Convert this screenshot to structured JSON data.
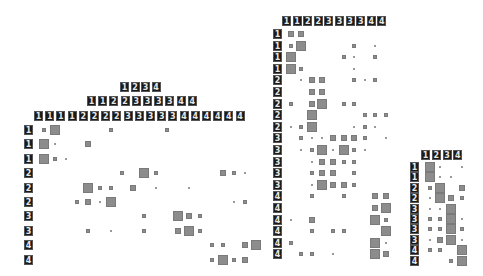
{
  "figure": {
    "size_scale_px": {
      "0": 0,
      "1": 2,
      "2": 4,
      "3": 6,
      "4": 10
    },
    "cell_color": "#8c8c8c",
    "panels": [
      {
        "name": "left",
        "headers": [
          {
            "x": 120,
            "y": 82,
            "dx": 10.5,
            "labels": [
              "1",
              "2",
              "3",
              "4"
            ]
          },
          {
            "x": 87,
            "y": 96,
            "dx": 11.2,
            "labels": [
              "1",
              "1",
              "2",
              "2",
              "3",
              "3",
              "3",
              "3",
              "4",
              "4"
            ]
          },
          {
            "x": 34,
            "y": 111,
            "dx": 11.2,
            "labels": [
              "1",
              "1",
              "1",
              "1",
              "2",
              "2",
              "2",
              "2",
              "3",
              "3",
              "3",
              "3",
              "3",
              "4",
              "4",
              "4",
              "4",
              "4",
              "4"
            ]
          }
        ],
        "row_label_x": 24,
        "cell_x0": 39,
        "cell_dx": 11.2,
        "row_y0": 125,
        "row_dy": 14.4,
        "row_labels": [
          "1",
          "1",
          "1",
          "2",
          "2",
          "2",
          "3",
          "3",
          "4",
          "4"
        ],
        "matrix": [
          [
            2,
            4,
            0,
            0,
            0,
            0,
            2,
            0,
            0,
            0,
            0,
            2,
            0,
            0,
            0,
            0,
            0,
            0,
            0
          ],
          [
            4,
            1,
            0,
            0,
            3,
            0,
            0,
            0,
            0,
            0,
            0,
            0,
            0,
            0,
            0,
            0,
            0,
            0,
            0
          ],
          [
            4,
            2,
            1,
            0,
            0,
            0,
            0,
            0,
            0,
            0,
            0,
            0,
            0,
            0,
            0,
            0,
            0,
            0,
            0
          ],
          [
            0,
            0,
            0,
            0,
            0,
            0,
            0,
            2,
            0,
            4,
            2,
            0,
            0,
            0,
            0,
            0,
            3,
            2,
            1
          ],
          [
            0,
            0,
            0,
            0,
            4,
            2,
            2,
            0,
            3,
            0,
            1,
            0,
            0,
            1,
            0,
            0,
            0,
            0,
            0
          ],
          [
            0,
            0,
            0,
            2,
            3,
            1,
            4,
            0,
            0,
            0,
            0,
            0,
            0,
            0,
            0,
            0,
            0,
            1,
            2
          ],
          [
            0,
            0,
            0,
            0,
            0,
            0,
            0,
            0,
            0,
            2,
            0,
            0,
            4,
            3,
            2,
            0,
            0,
            0,
            0
          ],
          [
            0,
            0,
            0,
            0,
            2,
            0,
            1,
            0,
            0,
            2,
            0,
            0,
            3,
            4,
            2,
            0,
            0,
            0,
            0
          ],
          [
            0,
            0,
            0,
            0,
            0,
            0,
            0,
            0,
            0,
            0,
            0,
            0,
            0,
            0,
            0,
            2,
            2,
            0,
            3,
            4
          ],
          [
            0,
            0,
            0,
            0,
            0,
            0,
            0,
            0,
            0,
            0,
            0,
            0,
            0,
            0,
            0,
            2,
            4,
            2,
            3,
            0
          ]
        ]
      },
      {
        "name": "middle",
        "headers": [
          {
            "x": 282,
            "y": 16,
            "dx": 10.6,
            "labels": [
              "1",
              "1",
              "2",
              "2",
              "3",
              "3",
              "3",
              "3",
              "4",
              "4"
            ]
          }
        ],
        "row_label_x": 273,
        "cell_x0": 286,
        "cell_dx": 10.6,
        "row_y0": 29,
        "row_dy": 11.6,
        "row_labels": [
          "1",
          "1",
          "1",
          "1",
          "2",
          "2",
          "2",
          "2",
          "2",
          "3",
          "3",
          "3",
          "3",
          "3",
          "4",
          "4",
          "4",
          "4",
          "4",
          "4"
        ],
        "matrix": [
          [
            3,
            3,
            0,
            0,
            0,
            0,
            0,
            0,
            0,
            0
          ],
          [
            2,
            4,
            0,
            0,
            0,
            0,
            2,
            0,
            1,
            0
          ],
          [
            4,
            0,
            0,
            0,
            0,
            2,
            1,
            0,
            2,
            0
          ],
          [
            4,
            2,
            0,
            0,
            0,
            0,
            1,
            0,
            0,
            0
          ],
          [
            0,
            1,
            3,
            3,
            0,
            0,
            2,
            1,
            2,
            0
          ],
          [
            0,
            0,
            3,
            3,
            0,
            0,
            0,
            0,
            0,
            0
          ],
          [
            2,
            0,
            3,
            4,
            0,
            2,
            2,
            0,
            0,
            0
          ],
          [
            0,
            0,
            4,
            0,
            0,
            0,
            0,
            2,
            2,
            2
          ],
          [
            1,
            2,
            4,
            0,
            0,
            0,
            1,
            2,
            1,
            0
          ],
          [
            0,
            2,
            1,
            1,
            3,
            3,
            3,
            2,
            0,
            1
          ],
          [
            0,
            1,
            2,
            4,
            1,
            4,
            2,
            1,
            0,
            0
          ],
          [
            0,
            0,
            1,
            3,
            3,
            2,
            2,
            0,
            0,
            0
          ],
          [
            0,
            0,
            2,
            3,
            3,
            0,
            2,
            0,
            0,
            0
          ],
          [
            0,
            0,
            1,
            4,
            3,
            3,
            2,
            0,
            0,
            0
          ],
          [
            0,
            0,
            2,
            0,
            0,
            2,
            0,
            0,
            3,
            3
          ],
          [
            0,
            0,
            0,
            0,
            0,
            0,
            0,
            0,
            3,
            4
          ],
          [
            1,
            0,
            3,
            0,
            0,
            0,
            0,
            0,
            4,
            2
          ],
          [
            0,
            0,
            2,
            0,
            2,
            2,
            0,
            0,
            0,
            4
          ],
          [
            2,
            0,
            0,
            0,
            0,
            0,
            0,
            0,
            4,
            1
          ],
          [
            0,
            2,
            2,
            0,
            1,
            0,
            0,
            0,
            4,
            3
          ]
        ]
      },
      {
        "name": "right",
        "headers": [
          {
            "x": 421,
            "y": 150,
            "dx": 10.8,
            "labels": [
              "1",
              "2",
              "3",
              "4"
            ]
          }
        ],
        "row_label_x": 410,
        "cell_x0": 425,
        "cell_dx": 10.8,
        "row_y0": 162,
        "row_dy": 10.4,
        "row_labels": [
          "1",
          "1",
          "2",
          "2",
          "3",
          "3",
          "3",
          "3",
          "4",
          "4"
        ],
        "matrix": [
          [
            4,
            1,
            0,
            1
          ],
          [
            4,
            1,
            1,
            0
          ],
          [
            2,
            4,
            0,
            3
          ],
          [
            1,
            4,
            3,
            2
          ],
          [
            1,
            1,
            4,
            0
          ],
          [
            2,
            2,
            4,
            1
          ],
          [
            2,
            2,
            4,
            2
          ],
          [
            1,
            3,
            4,
            1
          ],
          [
            2,
            2,
            0,
            4
          ],
          [
            0,
            0,
            2,
            4
          ]
        ]
      }
    ]
  }
}
